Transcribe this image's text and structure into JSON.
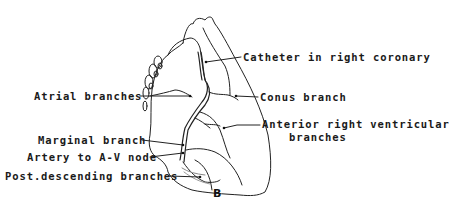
{
  "figure": {
    "panel_label": "B",
    "labels": {
      "catheter": "Catheter in right coronary",
      "atrial": "Atrial branches",
      "conus": "Conus branch",
      "marginal": "Marginal branch",
      "anterior_line1": "Anterior right ventricular",
      "anterior_line2": "branches",
      "av_node": "Artery to A-V node",
      "post_desc": "Post.descending branches"
    }
  }
}
